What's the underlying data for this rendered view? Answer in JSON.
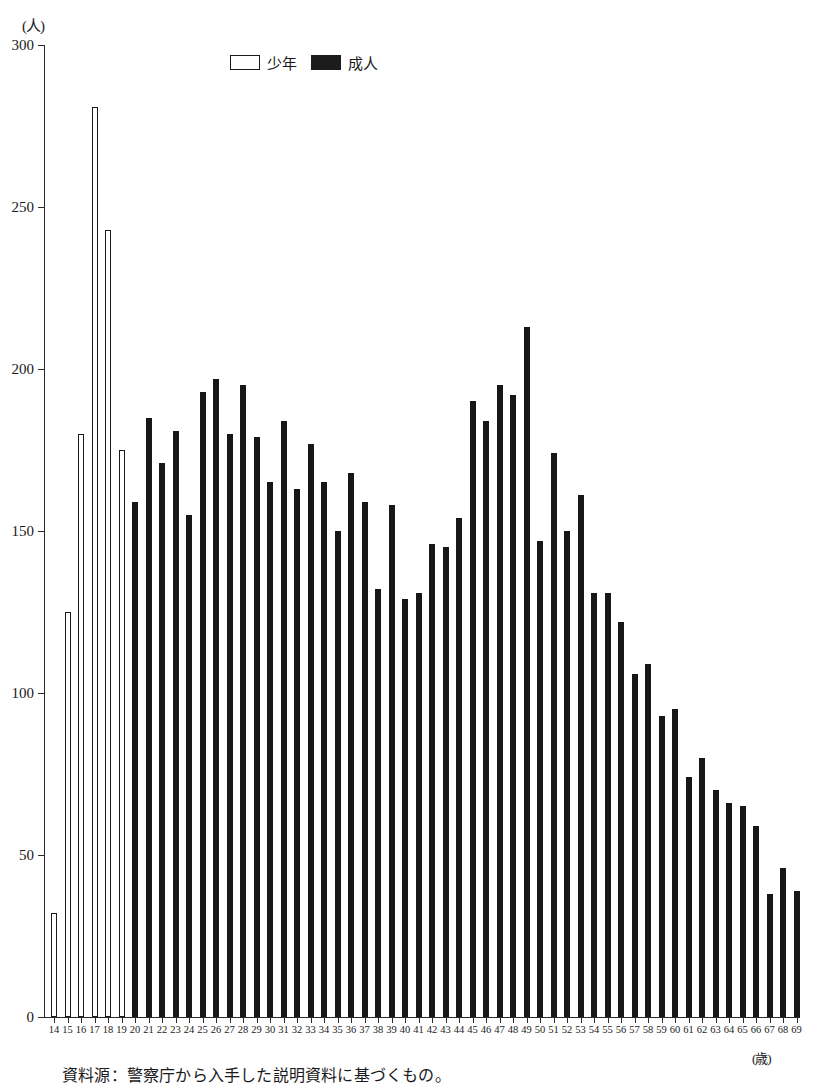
{
  "chart_data": {
    "type": "bar",
    "title": "",
    "subtitle": "",
    "xlabel": "(歳)",
    "ylabel": "(人)",
    "ylim": [
      0,
      300
    ],
    "ytick_values": [
      0,
      50,
      100,
      150,
      200,
      250,
      300
    ],
    "ytick_labels": [
      "0",
      "50",
      "100",
      "150",
      "200",
      "250",
      "300"
    ],
    "grid": false,
    "legend_position": "top-center",
    "categories": [
      "14",
      "15",
      "16",
      "17",
      "18",
      "19",
      "20",
      "21",
      "22",
      "23",
      "24",
      "25",
      "26",
      "27",
      "28",
      "29",
      "30",
      "31",
      "32",
      "33",
      "34",
      "35",
      "36",
      "37",
      "38",
      "39",
      "40",
      "41",
      "42",
      "43",
      "44",
      "45",
      "46",
      "47",
      "48",
      "49",
      "50",
      "51",
      "52",
      "53",
      "54",
      "55",
      "56",
      "57",
      "58",
      "59",
      "60",
      "61",
      "62",
      "63",
      "64",
      "65",
      "66",
      "67",
      "68",
      "69"
    ],
    "series": [
      {
        "name": "少年",
        "color": "#ffffff",
        "edgecolor": "#1a1a1a",
        "values": [
          32,
          125,
          180,
          281,
          243,
          175,
          null,
          null,
          null,
          null,
          null,
          null,
          null,
          null,
          null,
          null,
          null,
          null,
          null,
          null,
          null,
          null,
          null,
          null,
          null,
          null,
          null,
          null,
          null,
          null,
          null,
          null,
          null,
          null,
          null,
          null,
          null,
          null,
          null,
          null,
          null,
          null,
          null,
          null,
          null,
          null,
          null,
          null,
          null,
          null,
          null,
          null,
          null,
          null,
          null,
          null
        ]
      },
      {
        "name": "成人",
        "color": "#171717",
        "edgecolor": "#171717",
        "values": [
          null,
          null,
          null,
          null,
          null,
          null,
          159,
          185,
          171,
          181,
          155,
          193,
          197,
          180,
          195,
          179,
          165,
          184,
          163,
          177,
          165,
          150,
          168,
          159,
          132,
          158,
          129,
          131,
          146,
          145,
          154,
          190,
          184,
          195,
          192,
          213,
          147,
          174,
          150,
          161,
          131,
          131,
          122,
          106,
          109,
          93,
          95,
          74,
          80,
          70,
          66,
          65,
          59,
          38,
          46,
          39
        ]
      }
    ]
  },
  "legend": {
    "entries": [
      {
        "label": "少年",
        "style": "juvenile"
      },
      {
        "label": "成人",
        "style": "adult"
      }
    ]
  },
  "axes": {
    "y_unit": "(人)",
    "x_unit": "(歳)"
  },
  "footnote": {
    "text": "資料源：警察庁から入手した説明資料に基づくもの。"
  }
}
